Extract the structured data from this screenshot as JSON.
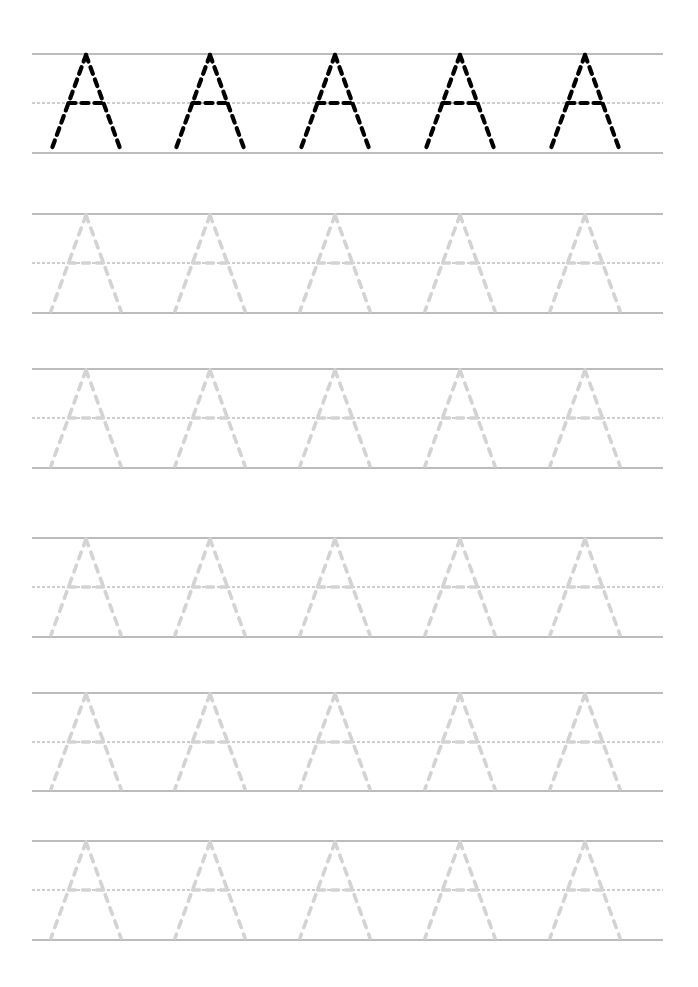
{
  "worksheet": {
    "letter": "A",
    "letters_per_row": 5,
    "letter_centers_x": [
      86,
      210,
      335,
      460,
      585
    ],
    "line_left_x": 32,
    "line_right_x": 663,
    "rows": [
      {
        "top": 54,
        "mid": 103,
        "bottom": 153,
        "style": "dark"
      },
      {
        "top": 214,
        "mid": 263,
        "bottom": 313,
        "style": "faded"
      },
      {
        "top": 369,
        "mid": 418,
        "bottom": 468,
        "style": "faded"
      },
      {
        "top": 538,
        "mid": 587,
        "bottom": 637,
        "style": "faded"
      },
      {
        "top": 693,
        "mid": 742,
        "bottom": 791,
        "style": "faded"
      },
      {
        "top": 841,
        "mid": 890,
        "bottom": 940,
        "style": "faded"
      }
    ],
    "colors": {
      "guide_line": "#7a7a7a",
      "mid_line": "#808080",
      "dark_letter": "#000000",
      "faded_letter": "#d3d3d3"
    }
  }
}
